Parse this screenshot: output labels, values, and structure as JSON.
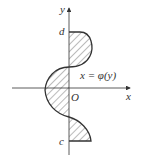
{
  "diagram": {
    "axes": {
      "x_label": "x",
      "y_label": "y",
      "origin_label": "O"
    },
    "bounds": {
      "upper_label": "d",
      "lower_label": "c"
    },
    "curve": {
      "label": "x = φ(y)"
    },
    "colors": {
      "stroke": "#333333",
      "hatch": "#555555",
      "background": "#ffffff"
    }
  }
}
